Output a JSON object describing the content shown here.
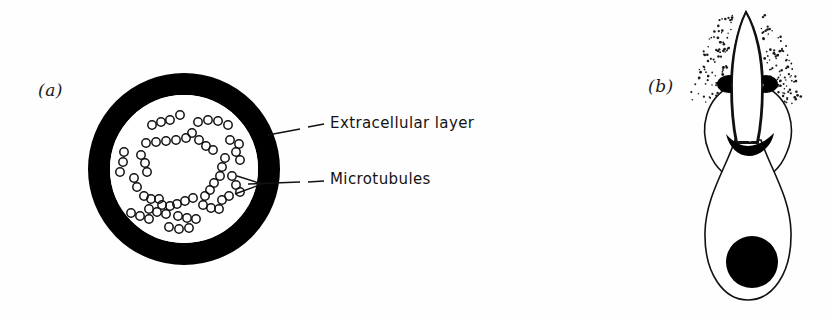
{
  "figure": {
    "type": "scientific-illustration",
    "background_color": "#fefefe",
    "ink_color": "#000000"
  },
  "panels": [
    {
      "id": "a",
      "label": "(a)",
      "name": "cross-section-panel",
      "description": "Circular cross-section with a thick black extracellular layer ring enclosing small open circles representing microtubules",
      "geometry": {
        "center_x": 184,
        "center_y": 169,
        "outer_radius": 96,
        "ring_thickness": 22,
        "inner_radius": 74
      }
    },
    {
      "id": "b",
      "label": "(b)",
      "name": "sperm-cell-panel",
      "description": "Longitudinal view of a sperm-like cell with stippled acrosomal tip, paired dark collar lobes, a dark crescent band, a pear-shaped body and a solid round nucleus",
      "geometry": {
        "apex_x": 746,
        "apex_y": 12,
        "body_center_x": 748,
        "body_center_y": 225,
        "nucleus_center_x": 752,
        "nucleus_center_y": 262,
        "nucleus_radius": 26
      }
    }
  ],
  "callouts": [
    {
      "name": "extracellular-layer",
      "text": "Extracellular  layer",
      "leader": {
        "from_x": 268,
        "from_y": 134,
        "to_x": 322,
        "to_y": 124,
        "style": "dashed-segment"
      }
    },
    {
      "name": "microtubules",
      "text": "Microtubules",
      "leader": {
        "from_x": 238,
        "from_y": 185,
        "to_x": 322,
        "to_y": 180,
        "style": "dashed-segment-with-arrow-fork"
      }
    }
  ],
  "microtubules": {
    "count": 62,
    "glyph": "open-circle",
    "radius": 4.2,
    "stroke": "#111111",
    "positions": [
      [
        152,
        125
      ],
      [
        161,
        122
      ],
      [
        170,
        120
      ],
      [
        180,
        115
      ],
      [
        198,
        122
      ],
      [
        208,
        120
      ],
      [
        218,
        121
      ],
      [
        228,
        125
      ],
      [
        192,
        133
      ],
      [
        199,
        140
      ],
      [
        206,
        146
      ],
      [
        213,
        150
      ],
      [
        146,
        143
      ],
      [
        156,
        142
      ],
      [
        166,
        141
      ],
      [
        176,
        140
      ],
      [
        186,
        138
      ],
      [
        230,
        140
      ],
      [
        239,
        144
      ],
      [
        236,
        152
      ],
      [
        240,
        160
      ],
      [
        124,
        152
      ],
      [
        123,
        162
      ],
      [
        120,
        172
      ],
      [
        141,
        155
      ],
      [
        145,
        163
      ],
      [
        147,
        172
      ],
      [
        225,
        158
      ],
      [
        222,
        167
      ],
      [
        220,
        176
      ],
      [
        134,
        178
      ],
      [
        137,
        187
      ],
      [
        214,
        183
      ],
      [
        210,
        190
      ],
      [
        205,
        196
      ],
      [
        144,
        196
      ],
      [
        151,
        199
      ],
      [
        159,
        199
      ],
      [
        193,
        198
      ],
      [
        185,
        201
      ],
      [
        177,
        204
      ],
      [
        149,
        209
      ],
      [
        157,
        212
      ],
      [
        166,
        214
      ],
      [
        170,
        206
      ],
      [
        162,
        205
      ],
      [
        131,
        213
      ],
      [
        140,
        216
      ],
      [
        149,
        219
      ],
      [
        203,
        205
      ],
      [
        211,
        208
      ],
      [
        219,
        209
      ],
      [
        178,
        216
      ],
      [
        187,
        218
      ],
      [
        196,
        219
      ],
      [
        232,
        176
      ],
      [
        236,
        185
      ],
      [
        240,
        192
      ],
      [
        169,
        227
      ],
      [
        179,
        229
      ],
      [
        189,
        228
      ],
      [
        229,
        196
      ],
      [
        222,
        200
      ]
    ]
  },
  "stipple": {
    "name": "acrosome-stipple-cloud",
    "description": "Fine dot texture surrounding the acrosomal tip",
    "dot_count": 190,
    "color": "#1a1a1a"
  }
}
